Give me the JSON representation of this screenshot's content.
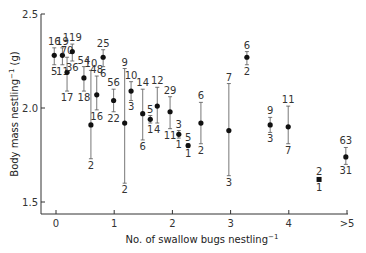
{
  "chart_data": {
    "type": "scatter",
    "title": "",
    "xlabel": "No. of swallow bugs nestling",
    "xlabel_sup": "−1",
    "ylabel": "Body mass nestling",
    "ylabel_sup": "−1",
    "ylabel_unit": " (g)",
    "xlim": [
      -0.25,
      5.3
    ],
    "ylim": [
      1.44,
      2.5
    ],
    "xticks": [
      {
        "value": 0,
        "label": "0"
      },
      {
        "value": 1,
        "label": "1"
      },
      {
        "value": 2,
        "label": "2"
      },
      {
        "value": 3,
        "label": "3"
      },
      {
        "value": 4,
        "label": "4"
      },
      {
        "value": 5,
        "label": ">5"
      }
    ],
    "yticks": [
      {
        "value": 1.5,
        "label": "1.5"
      },
      {
        "value": 2.0,
        "label": "2.0"
      },
      {
        "value": 2.5,
        "label": "2.5"
      }
    ],
    "grid": false,
    "legend": "none",
    "points": [
      {
        "x": -0.03,
        "y": 2.28,
        "upper": 2.32,
        "lower": 2.23,
        "n_top": "16",
        "n_bottom": "5"
      },
      {
        "x": 0.11,
        "y": 2.28,
        "upper": 2.32,
        "lower": 2.23,
        "n_top": "19",
        "n_bottom": "11"
      },
      {
        "x": 0.19,
        "y": 2.19,
        "upper": 2.27,
        "lower": 2.09,
        "n_top": "70",
        "n_bottom": "17"
      },
      {
        "x": 0.28,
        "y": 2.3,
        "upper": 2.34,
        "lower": 2.25,
        "n_top": "119",
        "n_bottom": "36"
      },
      {
        "x": 0.48,
        "y": 2.16,
        "upper": 2.22,
        "lower": 2.09,
        "n_top": "54",
        "n_bottom": "18"
      },
      {
        "x": 0.6,
        "y": 1.91,
        "upper": 2.2,
        "lower": 1.73,
        "n_top": "10",
        "n_bottom": "2"
      },
      {
        "x": 0.7,
        "y": 2.07,
        "upper": 2.17,
        "lower": 1.99,
        "n_top": "48",
        "n_bottom": "16"
      },
      {
        "x": 0.81,
        "y": 2.27,
        "upper": 2.31,
        "lower": 2.22,
        "n_top": "25",
        "n_bottom": "6"
      },
      {
        "x": 0.99,
        "y": 2.04,
        "upper": 2.1,
        "lower": 1.98,
        "n_top": "56",
        "n_bottom": "22"
      },
      {
        "x": 1.18,
        "y": 1.92,
        "upper": 2.21,
        "lower": 1.6,
        "n_top": "9",
        "n_bottom": "2"
      },
      {
        "x": 1.29,
        "y": 2.09,
        "upper": 2.14,
        "lower": 2.04,
        "n_top": "10",
        "n_bottom": "3"
      },
      {
        "x": 1.49,
        "y": 1.97,
        "upper": 2.1,
        "lower": 1.83,
        "n_top": "14",
        "n_bottom": "6"
      },
      {
        "x": 1.62,
        "y": 1.94,
        "upper": 1.96,
        "lower": 1.92,
        "n_top": "5",
        "n_bottom": "1"
      },
      {
        "x": 1.74,
        "y": 2.01,
        "upper": 2.11,
        "lower": 1.92,
        "n_top": "12",
        "n_bottom": "4"
      },
      {
        "x": 1.96,
        "y": 1.98,
        "upper": 2.06,
        "lower": 1.89,
        "n_top": "29",
        "n_bottom": "11"
      },
      {
        "x": 2.11,
        "y": 1.86,
        "upper": 1.88,
        "lower": 1.84,
        "n_top": "3",
        "n_bottom": "1"
      },
      {
        "x": 2.27,
        "y": 1.8,
        "upper": 1.81,
        "lower": 1.79,
        "n_top": "5",
        "n_bottom": "1"
      },
      {
        "x": 2.49,
        "y": 1.92,
        "upper": 2.03,
        "lower": 1.81,
        "n_top": "6",
        "n_bottom": "2"
      },
      {
        "x": 2.97,
        "y": 1.88,
        "upper": 2.13,
        "lower": 1.64,
        "n_top": "7",
        "n_bottom": "3"
      },
      {
        "x": 3.28,
        "y": 2.27,
        "upper": 2.3,
        "lower": 2.23,
        "n_top": "6",
        "n_bottom": "2"
      },
      {
        "x": 3.68,
        "y": 1.91,
        "upper": 1.95,
        "lower": 1.87,
        "n_top": "9",
        "n_bottom": "3"
      },
      {
        "x": 3.99,
        "y": 1.9,
        "upper": 2.01,
        "lower": 1.81,
        "n_top": "11",
        "n_bottom": "7"
      },
      {
        "x": 4.52,
        "y": 1.62,
        "upper": 1.63,
        "lower": 1.61,
        "n_top": "2",
        "n_bottom": "1",
        "marker": "square"
      },
      {
        "x": 4.98,
        "y": 1.74,
        "upper": 1.79,
        "lower": 1.7,
        "n_top": "63",
        "n_bottom": "31"
      }
    ]
  }
}
